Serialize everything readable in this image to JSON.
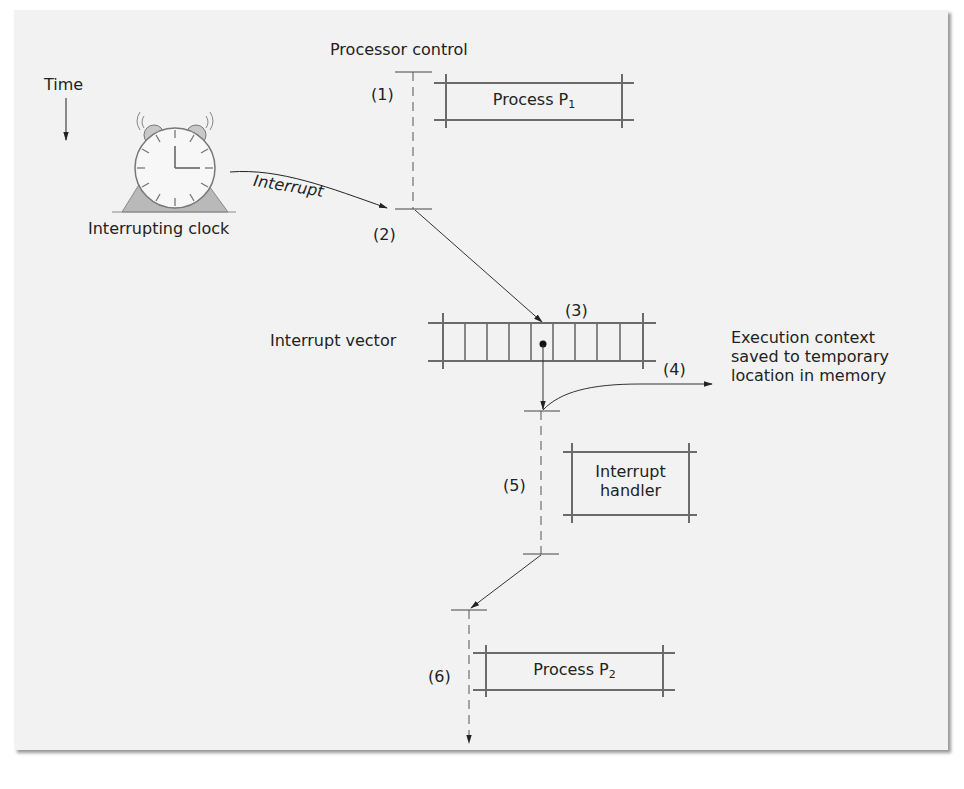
{
  "figure": {
    "axis": {
      "time_label": "Time",
      "control_label": "Processor control"
    },
    "clock": {
      "label": "Interrupting clock",
      "arrow_label": "Interrupt"
    },
    "steps": [
      {
        "id": "1",
        "label": "(1)"
      },
      {
        "id": "2",
        "label": "(2)"
      },
      {
        "id": "3",
        "label": "(3)"
      },
      {
        "id": "4",
        "label": "(4)"
      },
      {
        "id": "5",
        "label": "(5)"
      },
      {
        "id": "6",
        "label": "(6)"
      }
    ],
    "process_p1": {
      "text": "Process P",
      "sub": "1"
    },
    "interrupt_vector": {
      "label": "Interrupt vector",
      "cells": 9,
      "selected_cell": 5
    },
    "context_save": {
      "lines": [
        "Execution context",
        "saved to temporary",
        "location in memory"
      ]
    },
    "interrupt_handler": {
      "lines": [
        "Interrupt",
        "handler"
      ]
    },
    "process_p2": {
      "text": "Process P",
      "sub": "2"
    }
  },
  "colors": {
    "panel_bg": "#f2f2f2",
    "ink": "#222222",
    "box_stroke": "#6b6b6b",
    "clock_fill": "#b9b9b9"
  }
}
